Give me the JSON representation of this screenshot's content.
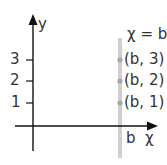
{
  "diagram": {
    "axes": {
      "x_label": "χ",
      "y_label": "y"
    },
    "y_ticks": [
      {
        "label": "3",
        "y": 60
      },
      {
        "label": "2",
        "y": 81
      },
      {
        "label": "1",
        "y": 103
      }
    ],
    "vertical_line": {
      "equation": "χ = b",
      "x_label": "b",
      "color": "#c8c8c8"
    },
    "points": [
      {
        "label": "(b, 3)",
        "y": 60
      },
      {
        "label": "(b, 2)",
        "y": 81
      },
      {
        "label": "(b, 1)",
        "y": 103
      }
    ],
    "colors": {
      "axis": "#111111",
      "point": "#a8a8a8",
      "text": "#333333"
    }
  }
}
